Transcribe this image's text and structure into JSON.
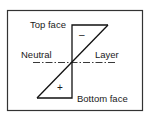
{
  "diagram": {
    "labels": {
      "top_face": "Top face",
      "neutral": "Neutral",
      "layer": "Layer",
      "bottom_face": "Bottom face"
    },
    "signs": {
      "upper_region": "–",
      "lower_region": "+"
    },
    "colors": {
      "ink": "#1a1a1a",
      "background": "#ffffff"
    }
  }
}
